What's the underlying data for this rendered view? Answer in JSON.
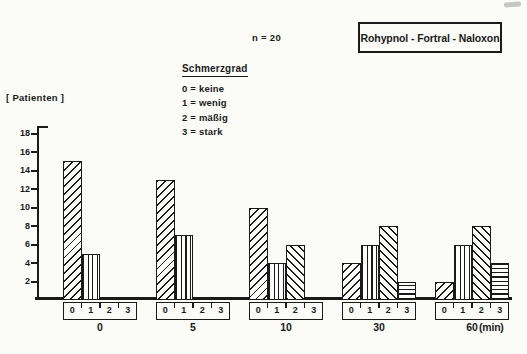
{
  "header": {
    "n_label": "n = 20",
    "title": "Rohypnol - Fortral - Naloxon"
  },
  "legend": {
    "title": "Schmerzgrad",
    "items": [
      {
        "text": "0 = keine"
      },
      {
        "text": "1 = wenig"
      },
      {
        "text": "2 = mäßig"
      },
      {
        "text": "3 = stark"
      }
    ]
  },
  "colors": {
    "ink": "#1a1a1a",
    "paper": "#fbfbf8"
  },
  "chart_data": {
    "type": "bar",
    "title": "Rohypnol - Fortral - Naloxon",
    "n_annotation": "n = 20",
    "ylabel": "[ Patienten ]",
    "xlabel": "(min)",
    "ylim": [
      0,
      18
    ],
    "yticks": [
      2,
      4,
      6,
      8,
      10,
      12,
      14,
      16,
      18
    ],
    "grid": false,
    "categories": [
      "0",
      "5",
      "10",
      "30",
      "60"
    ],
    "grade_labels": [
      "0",
      "1",
      "2",
      "3"
    ],
    "legend_position": "above-plot-left",
    "series": [
      {
        "name": "0 = keine",
        "hatch": "diagonal-up",
        "values": [
          15,
          13,
          10,
          4,
          2
        ]
      },
      {
        "name": "1 = wenig",
        "hatch": "vertical",
        "values": [
          5,
          7,
          4,
          6,
          6
        ]
      },
      {
        "name": "2 = mäßig",
        "hatch": "diagonal-down",
        "values": [
          0,
          0,
          6,
          8,
          8
        ]
      },
      {
        "name": "3 = stark",
        "hatch": "horizontal",
        "values": [
          0,
          0,
          0,
          2,
          4
        ]
      }
    ]
  }
}
